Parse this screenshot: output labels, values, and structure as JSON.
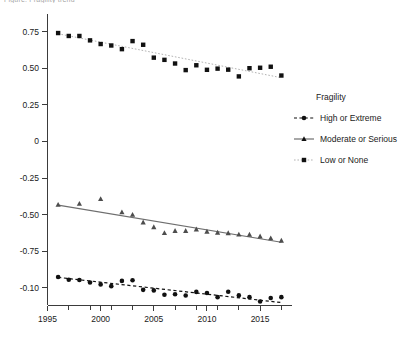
{
  "title": "Figure: Fragility trend",
  "chart_data": {
    "type": "scatter",
    "title": "Figure: Fragility trend",
    "xlabel": "",
    "ylabel": "",
    "xlim": [
      1995,
      2018
    ],
    "ylim": [
      -1.12,
      0.87
    ],
    "grid": false,
    "legend_position": "right",
    "x_ticks_major": [
      1995,
      2000,
      2005,
      2010,
      2015
    ],
    "x_ticks_minor": [
      1996,
      1997,
      1998,
      1999,
      2001,
      2002,
      2003,
      2004,
      2006,
      2007,
      2008,
      2009,
      2011,
      2012,
      2013,
      2014,
      2016,
      2017
    ],
    "x_tick_labels": [
      "1995",
      "2000",
      "2005",
      "2010",
      "2015"
    ],
    "y_ticks": [
      0.75,
      0.5,
      0.25,
      0,
      -0.25,
      -0.5,
      -0.75,
      -1.0
    ],
    "y_tick_labels": [
      "0.75",
      "0.50",
      "0.25",
      "0",
      "-0.25",
      "-0.50",
      "-0.75",
      "-0.10"
    ],
    "legend_title": "Fragility",
    "series": [
      {
        "name": "High or Extreme",
        "marker": "circle",
        "linestyle": "dashed",
        "color": "#111111",
        "x": [
          1996,
          1997,
          1998,
          1999,
          2000,
          2001,
          2002,
          2003,
          2004,
          2005,
          2006,
          2007,
          2008,
          2009,
          2010,
          2011,
          2012,
          2013,
          2014,
          2015,
          2016,
          2017
        ],
        "values": [
          -0.925,
          -0.944,
          -0.946,
          -0.963,
          -0.976,
          -0.988,
          -0.952,
          -0.948,
          -1.013,
          -1.017,
          -1.047,
          -1.043,
          -1.052,
          -1.027,
          -1.035,
          -1.063,
          -1.026,
          -1.051,
          -1.063,
          -1.093,
          -1.069,
          -1.063
        ],
        "trend_start": [
          1996,
          -0.928
        ],
        "trend_end": [
          2017,
          -1.1
        ]
      },
      {
        "name": "Moderate or Serious",
        "marker": "triangle",
        "linestyle": "solid",
        "color": "#4d4d4d",
        "x": [
          1996,
          1998,
          2000,
          2002,
          2003,
          2004,
          2005,
          2006,
          2007,
          2008,
          2009,
          2010,
          2011,
          2012,
          2013,
          2014,
          2015,
          2016,
          2017
        ],
        "values": [
          -0.432,
          -0.425,
          -0.393,
          -0.483,
          -0.5,
          -0.552,
          -0.585,
          -0.625,
          -0.61,
          -0.61,
          -0.6,
          -0.615,
          -0.622,
          -0.626,
          -0.635,
          -0.636,
          -0.648,
          -0.661,
          -0.677
        ],
        "trend_start": [
          1996,
          -0.435
        ],
        "trend_end": [
          2017,
          -0.688
        ]
      },
      {
        "name": "Low or None",
        "marker": "square",
        "linestyle": "dotted",
        "color": "#111111",
        "x": [
          1996,
          1997,
          1998,
          1999,
          2000,
          2001,
          2002,
          2003,
          2004,
          2005,
          2006,
          2007,
          2008,
          2009,
          2010,
          2011,
          2012,
          2013,
          2014,
          2015,
          2016,
          2017
        ],
        "values": [
          0.74,
          0.72,
          0.72,
          0.69,
          0.665,
          0.655,
          0.63,
          0.685,
          0.66,
          0.572,
          0.557,
          0.532,
          0.487,
          0.52,
          0.489,
          0.497,
          0.49,
          0.444,
          0.5,
          0.503,
          0.51,
          0.45
        ],
        "trend_start": [
          1996,
          0.735
        ],
        "trend_end": [
          2017,
          0.435
        ]
      }
    ]
  },
  "legend": {
    "title": "Fragility",
    "items": [
      {
        "label": "High or Extreme",
        "marker": "circle",
        "linestyle": "dashed"
      },
      {
        "label": "Moderate or Serious",
        "marker": "triangle",
        "linestyle": "solid"
      },
      {
        "label": "Low or None",
        "marker": "square",
        "linestyle": "dotted"
      }
    ]
  },
  "colors": {
    "axis": "#3b3b3b",
    "text": "#1a1a1a",
    "series_dark": "#111111",
    "series_gray": "#4d4d4d",
    "series_light": "#9a9a9a",
    "background": "#ffffff"
  }
}
